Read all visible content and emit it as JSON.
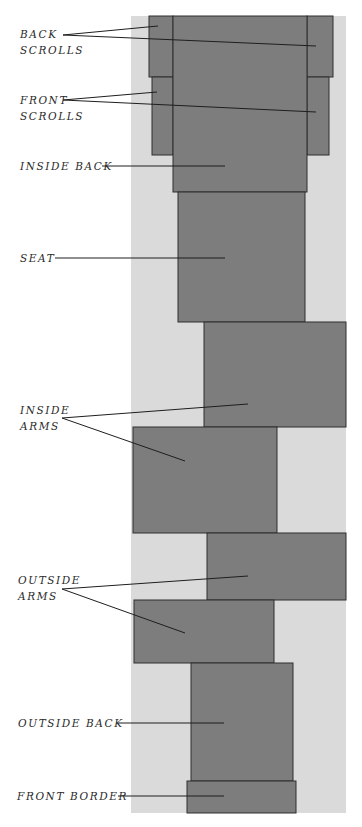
{
  "diagram": {
    "type": "upholstery fabric cutting layout",
    "colors": {
      "background": "#ffffff",
      "fabric": "#dadada",
      "piece": "#7d7d7d",
      "outline": "#2e2e2e"
    },
    "labels": [
      {
        "id": "back-scrolls",
        "lines": [
          "BACK",
          "SCROLLS"
        ]
      },
      {
        "id": "front-scrolls",
        "lines": [
          "FRONT",
          "SCROLLS"
        ]
      },
      {
        "id": "inside-back",
        "lines": [
          "INSIDE BACK"
        ]
      },
      {
        "id": "seat",
        "lines": [
          "SEAT"
        ]
      },
      {
        "id": "inside-arms",
        "lines": [
          "INSIDE",
          "ARMS"
        ]
      },
      {
        "id": "outside-arms",
        "lines": [
          "OUTSIDE",
          "ARMS"
        ]
      },
      {
        "id": "outside-back",
        "lines": [
          "OUTSIDE BACK"
        ]
      },
      {
        "id": "front-border",
        "lines": [
          "FRONT BORDER"
        ]
      }
    ]
  }
}
